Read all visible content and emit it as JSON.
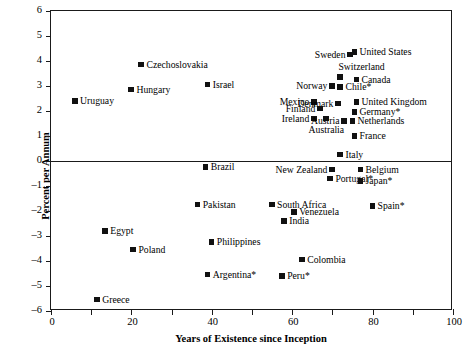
{
  "chart_data": {
    "type": "scatter",
    "title": "",
    "xlabel": "Years of Existence since Inception",
    "ylabel": "Percent per Annum",
    "xlim": [
      0,
      100
    ],
    "ylim": [
      -6,
      6
    ],
    "xticks": [
      0,
      10,
      20,
      30,
      40,
      50,
      60,
      70,
      80,
      90,
      100
    ],
    "xtick_labels": [
      "0",
      "",
      "20",
      "",
      "40",
      "",
      "60",
      "",
      "80",
      "",
      "100"
    ],
    "yticks": [
      6,
      5,
      4,
      3,
      2,
      1,
      0,
      -1,
      -2,
      -3,
      -4,
      -5,
      -6
    ],
    "ytick_labels": [
      "6",
      "5",
      "4",
      "3",
      "2",
      "1",
      "0",
      "–1",
      "–2",
      "–3",
      "–4",
      "–5",
      "–6"
    ],
    "grid": false,
    "legend": "none",
    "marker": "filled-square",
    "marker_color": "#111111",
    "zero_line": 0,
    "points": [
      {
        "label": "Uruguay",
        "x": 6.0,
        "y": 2.4,
        "lp": "right"
      },
      {
        "label": "Hungary",
        "x": 20.0,
        "y": 2.85,
        "lp": "right"
      },
      {
        "label": "Czechoslovakia",
        "x": 22.5,
        "y": 3.85,
        "lp": "right"
      },
      {
        "label": "Israel",
        "x": 39.0,
        "y": 3.05,
        "lp": "right"
      },
      {
        "label": "Sweden",
        "x": 74.5,
        "y": 4.25,
        "lp": "left"
      },
      {
        "label": "United States",
        "x": 75.5,
        "y": 4.35,
        "lp": "right"
      },
      {
        "label": "Switzerland",
        "x": 72.0,
        "y": 3.35,
        "lp": "aboveright"
      },
      {
        "label": "Canada",
        "x": 76.0,
        "y": 3.25,
        "lp": "right"
      },
      {
        "label": "Norway",
        "x": 70.0,
        "y": 3.0,
        "lp": "left"
      },
      {
        "label": "Chile*",
        "x": 72.0,
        "y": 2.95,
        "lp": "right"
      },
      {
        "label": "Mexico",
        "x": 65.5,
        "y": 2.35,
        "lp": "left"
      },
      {
        "label": "Denmark",
        "x": 71.5,
        "y": 2.3,
        "lp": "left"
      },
      {
        "label": "United Kingdom",
        "x": 76.0,
        "y": 2.35,
        "lp": "right"
      },
      {
        "label": "Finland",
        "x": 67.0,
        "y": 2.1,
        "lp": "left"
      },
      {
        "label": "Germany*",
        "x": 75.5,
        "y": 1.95,
        "lp": "right"
      },
      {
        "label": "Ireland",
        "x": 65.5,
        "y": 1.7,
        "lp": "left"
      },
      {
        "label": "Austria",
        "x": 73.0,
        "y": 1.6,
        "lp": "left"
      },
      {
        "label": "Netherlands",
        "x": 75.0,
        "y": 1.6,
        "lp": "right"
      },
      {
        "label": "Australia",
        "x": 68.5,
        "y": 1.7,
        "lp": "below"
      },
      {
        "label": "France",
        "x": 75.5,
        "y": 1.0,
        "lp": "right"
      },
      {
        "label": "Italy",
        "x": 72.0,
        "y": 0.25,
        "lp": "right"
      },
      {
        "label": "Brazil",
        "x": 38.5,
        "y": -0.25,
        "lp": "right"
      },
      {
        "label": "New Zealand",
        "x": 70.0,
        "y": -0.35,
        "lp": "left"
      },
      {
        "label": "Belgium",
        "x": 77.0,
        "y": -0.35,
        "lp": "right"
      },
      {
        "label": "Portugal*",
        "x": 69.5,
        "y": -0.7,
        "lp": "right"
      },
      {
        "label": "Japan*",
        "x": 77.0,
        "y": -0.8,
        "lp": "right"
      },
      {
        "label": "Pakistan",
        "x": 36.5,
        "y": -1.75,
        "lp": "right"
      },
      {
        "label": "South Africa",
        "x": 55.0,
        "y": -1.75,
        "lp": "right"
      },
      {
        "label": "Spain*",
        "x": 80.0,
        "y": -1.8,
        "lp": "right"
      },
      {
        "label": "Venezuela",
        "x": 60.5,
        "y": -2.05,
        "lp": "right"
      },
      {
        "label": "India",
        "x": 58.0,
        "y": -2.4,
        "lp": "right"
      },
      {
        "label": "Egypt",
        "x": 13.5,
        "y": -2.8,
        "lp": "right"
      },
      {
        "label": "Poland",
        "x": 20.5,
        "y": -3.55,
        "lp": "right"
      },
      {
        "label": "Philippines",
        "x": 40.0,
        "y": -3.25,
        "lp": "right"
      },
      {
        "label": "Colombia",
        "x": 62.5,
        "y": -3.95,
        "lp": "right"
      },
      {
        "label": "Argentina*",
        "x": 39.0,
        "y": -4.55,
        "lp": "right"
      },
      {
        "label": "Peru*",
        "x": 57.5,
        "y": -4.6,
        "lp": "right"
      },
      {
        "label": "Greece",
        "x": 11.5,
        "y": -5.55,
        "lp": "right"
      }
    ]
  }
}
